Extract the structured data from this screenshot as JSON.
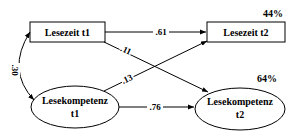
{
  "nodes": {
    "lesezeit_t1": {
      "label": "Lesezeit t1"
    },
    "lesezeit_t2": {
      "label": "Lesezeit t2",
      "r2": "44%"
    },
    "lesekompetenz_t1": {
      "line1": "Lesekompetenz",
      "line2": "t1"
    },
    "lesekompetenz_t2": {
      "line1": "Lesekompetenz",
      "line2": "t2",
      "r2": "64%"
    }
  },
  "paths": {
    "lz1_lz2": ".61",
    "lz1_lk2": ".11",
    "lk1_lz2": ".13",
    "lk1_lk2": ".76",
    "lz1_lk1_correlation": ".30"
  }
}
